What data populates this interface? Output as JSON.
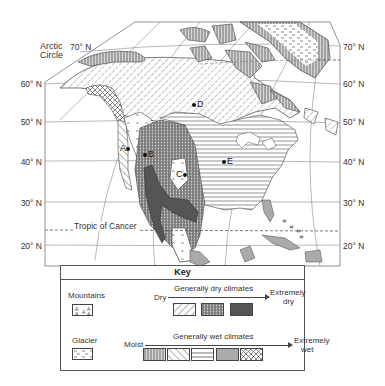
{
  "map": {
    "latitude_labels_left": [
      "70° N",
      "60° N",
      "50° N",
      "40° N",
      "30° N",
      "20° N"
    ],
    "latitude_labels_right": [
      "70° N",
      "60° N",
      "50° N",
      "40° N",
      "30° N",
      "20° N"
    ],
    "arctic_circle_label": "Arctic Circle",
    "arctic_circle_line1": "Arctic",
    "arctic_circle_line2": "Circle",
    "tropic_label": "Tropic of Cancer",
    "points": [
      {
        "label": "A"
      },
      {
        "label": "B"
      },
      {
        "label": "C"
      },
      {
        "label": "D"
      },
      {
        "label": "E"
      }
    ]
  },
  "key": {
    "title": "Key",
    "mountains_label": "Mountains",
    "glacier_label": "Glacier",
    "dry_start": "Dry",
    "dry_heading": "Generally dry climates",
    "dry_end_line1": "Extremely",
    "dry_end_line2": "dry",
    "wet_start": "Moist",
    "wet_heading": "Generally wet climates",
    "wet_end_line1": "Extremely",
    "wet_end_line2": "wet",
    "dry_swatches": [
      "dry-diagonal-hatch",
      "dry-dotted-vertical",
      "extremely-dry-dark"
    ],
    "wet_swatches": [
      "moist-vertical-lines",
      "wet-diagonal-hatch",
      "wet-horizontal-lines",
      "wet-gray-solid",
      "extremely-wet-crosshatch"
    ]
  }
}
